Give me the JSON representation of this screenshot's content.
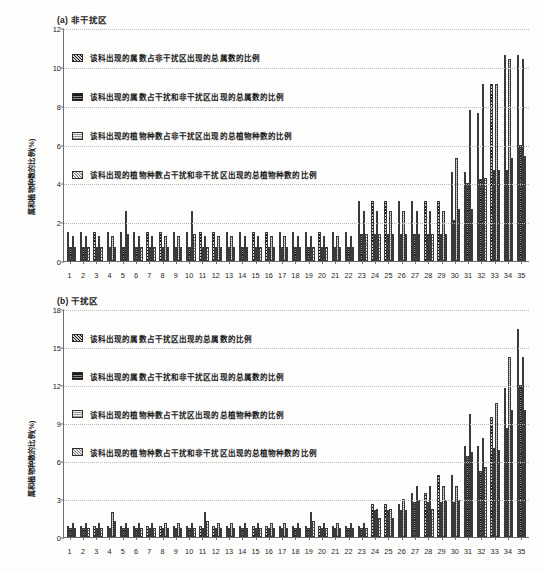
{
  "figure": {
    "y_axis_label": "属和植物种数的比例(%)"
  },
  "chart_data": [
    {
      "type": "bar",
      "panel": "a",
      "title": "(a) 非干扰区",
      "xlabel": "",
      "ylabel": "属和植物种数的比例(%)",
      "ylim": [
        0,
        12
      ],
      "yticks": [
        0,
        2,
        4,
        6,
        8,
        10,
        12
      ],
      "grid": true,
      "legend_position": "top-left",
      "categories": [
        "1",
        "2",
        "3",
        "4",
        "5",
        "6",
        "7",
        "8",
        "9",
        "10",
        "11",
        "12",
        "13",
        "14",
        "15",
        "16",
        "17",
        "18",
        "19",
        "20",
        "21",
        "22",
        "23",
        "24",
        "25",
        "26",
        "27",
        "28",
        "29",
        "30",
        "31",
        "32",
        "33",
        "34",
        "35"
      ],
      "series": [
        {
          "name": "该科出现的属数占非干扰区出现的总属数的比例",
          "pattern": "diagonal-stripe",
          "values": [
            1.5,
            1.5,
            1.5,
            1.5,
            1.5,
            1.5,
            1.5,
            1.5,
            1.5,
            1.5,
            1.5,
            1.5,
            1.5,
            1.5,
            1.5,
            1.5,
            1.5,
            1.5,
            1.5,
            1.5,
            1.5,
            1.5,
            3.1,
            3.1,
            3.1,
            3.1,
            3.1,
            3.1,
            3.1,
            4.6,
            4.6,
            7.6,
            9.1,
            10.6,
            10.6
          ]
        },
        {
          "name": "该科出现的属数占干扰和非干扰区出现的总属数的比例",
          "pattern": "dark-horizontal",
          "values": [
            0.7,
            0.7,
            0.7,
            0.7,
            0.7,
            0.7,
            0.7,
            0.7,
            0.7,
            0.7,
            0.7,
            0.7,
            0.7,
            0.7,
            0.7,
            0.7,
            0.7,
            0.7,
            0.7,
            0.7,
            0.7,
            0.7,
            1.4,
            1.4,
            1.4,
            1.4,
            1.4,
            1.4,
            1.4,
            2.1,
            4.0,
            4.2,
            4.7,
            4.7,
            6.0
          ]
        },
        {
          "name": "该科出现的植物种数占非干扰区出现的总植物种数的比例",
          "pattern": "light-dotted",
          "values": [
            1.3,
            1.3,
            1.3,
            1.3,
            2.6,
            1.3,
            1.3,
            1.3,
            1.3,
            2.6,
            1.3,
            1.3,
            1.3,
            1.3,
            1.3,
            1.3,
            1.3,
            1.3,
            1.3,
            1.3,
            1.3,
            1.3,
            2.6,
            2.6,
            2.6,
            2.6,
            2.6,
            2.6,
            2.6,
            5.3,
            7.8,
            9.1,
            9.1,
            10.4,
            10.4
          ]
        },
        {
          "name": "该科出现的植物种数占干扰和非干扰区出现的总植物种数的比例",
          "pattern": "checkered",
          "values": [
            0.7,
            0.7,
            0.7,
            0.7,
            1.4,
            0.7,
            0.7,
            0.7,
            0.7,
            1.4,
            0.7,
            0.7,
            0.7,
            0.7,
            0.7,
            0.7,
            0.7,
            0.7,
            0.7,
            0.7,
            0.7,
            0.7,
            1.4,
            1.4,
            1.4,
            1.4,
            1.4,
            1.4,
            1.4,
            2.7,
            2.7,
            4.3,
            4.7,
            5.3,
            5.4
          ]
        }
      ]
    },
    {
      "type": "bar",
      "panel": "b",
      "title": "(b) 干扰区",
      "xlabel": "",
      "ylabel": "属和植物种数的比例(%)",
      "ylim": [
        0,
        18
      ],
      "yticks": [
        0,
        3,
        6,
        9,
        12,
        15,
        18
      ],
      "grid": true,
      "legend_position": "top-left",
      "categories": [
        "1",
        "2",
        "3",
        "4",
        "5",
        "6",
        "7",
        "8",
        "9",
        "10",
        "11",
        "12",
        "13",
        "14",
        "15",
        "16",
        "17",
        "18",
        "19",
        "20",
        "21",
        "22",
        "23",
        "24",
        "25",
        "26",
        "27",
        "28",
        "29",
        "30",
        "31",
        "32",
        "33",
        "34",
        "35"
      ],
      "series": [
        {
          "name": "该科出现的属数占干扰区出现的总属数的比例",
          "pattern": "diagonal-stripe",
          "values": [
            0.9,
            0.9,
            0.9,
            0.9,
            0.9,
            0.9,
            0.9,
            0.9,
            0.9,
            0.9,
            0.9,
            0.9,
            0.9,
            0.9,
            0.9,
            0.9,
            0.9,
            0.9,
            0.9,
            0.9,
            0.9,
            0.9,
            0.9,
            2.6,
            2.6,
            2.6,
            3.5,
            3.5,
            4.9,
            4.9,
            7.2,
            7.2,
            9.5,
            11.8,
            16.4
          ]
        },
        {
          "name": "该科出现的属数占干扰和非干扰区出现的总属数的比例",
          "pattern": "dark-horizontal",
          "values": [
            0.7,
            0.7,
            0.7,
            0.7,
            0.7,
            0.7,
            0.7,
            0.7,
            0.7,
            0.7,
            0.7,
            0.7,
            0.7,
            0.7,
            0.7,
            0.7,
            0.7,
            0.7,
            0.7,
            0.7,
            0.7,
            0.7,
            0.7,
            2.1,
            2.1,
            2.1,
            2.8,
            2.8,
            2.8,
            2.8,
            6.4,
            5.2,
            7.0,
            8.6,
            12.0
          ]
        },
        {
          "name": "该科出现的植物种数占干扰区出现的总植物种数的比例",
          "pattern": "light-dotted",
          "values": [
            1.1,
            1.1,
            1.1,
            2.0,
            1.1,
            1.1,
            1.1,
            1.1,
            1.1,
            1.1,
            2.0,
            1.1,
            1.1,
            1.1,
            1.1,
            1.1,
            1.1,
            1.1,
            2.0,
            1.1,
            1.1,
            1.1,
            1.1,
            2.2,
            2.2,
            3.0,
            4.0,
            4.0,
            4.0,
            4.0,
            9.7,
            7.8,
            10.6,
            14.2,
            14.2
          ]
        },
        {
          "name": "该科出现的植物种数占干扰和非干扰区出现的总植物种数的比例",
          "pattern": "checkered",
          "values": [
            0.7,
            0.7,
            0.7,
            1.3,
            0.7,
            0.7,
            0.7,
            0.7,
            0.7,
            0.7,
            1.3,
            0.7,
            0.7,
            0.7,
            0.7,
            0.7,
            0.7,
            0.7,
            1.3,
            0.7,
            0.7,
            0.7,
            0.7,
            1.5,
            1.5,
            2.1,
            2.9,
            2.2,
            2.9,
            2.9,
            6.7,
            5.5,
            6.9,
            10.0,
            10.0
          ]
        }
      ]
    }
  ]
}
